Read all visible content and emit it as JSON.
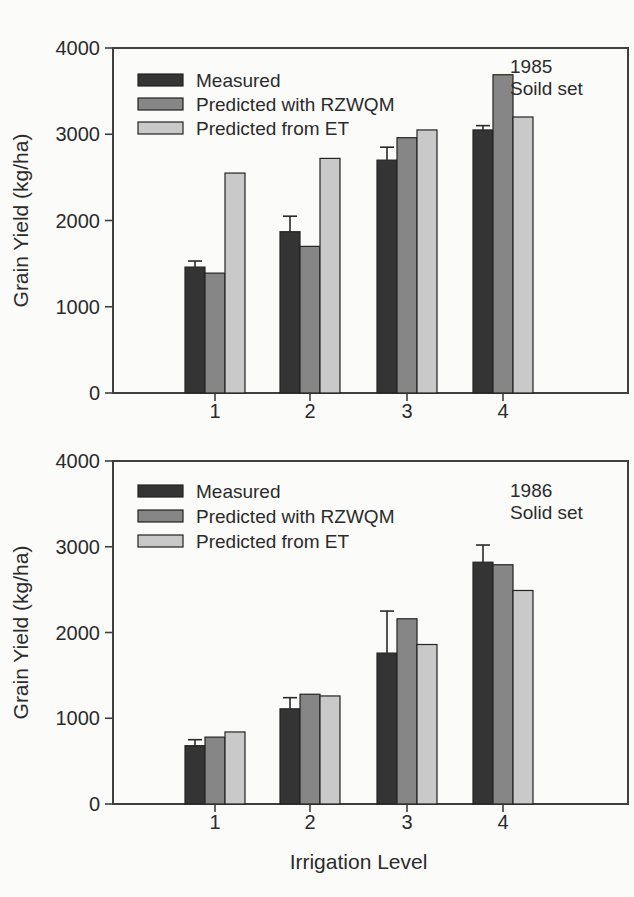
{
  "figure": {
    "background": "#fbfbfa",
    "text_color": "#2b2b2b",
    "axis_color": "#3f3f3f",
    "bar_outline_color": "#242424",
    "error_bar_color": "#2a2a2a"
  },
  "chart_data": [
    {
      "type": "bar",
      "annotation": [
        "1985",
        "Soild set"
      ],
      "ylabel": "Grain Yield (kg/ha)",
      "xlabel": "",
      "categories": [
        "1",
        "2",
        "3",
        "4"
      ],
      "ylim": [
        0,
        4000
      ],
      "yticks": [
        4000,
        3000,
        2000,
        1000,
        0
      ],
      "grid": false,
      "legend_position": "top-left",
      "series": [
        {
          "name": "Measured",
          "color": "#343434",
          "values": [
            1460,
            1870,
            2700,
            3050
          ],
          "errors_upper": [
            1530,
            2050,
            2850,
            3100
          ]
        },
        {
          "name": "Predicted with RZWQM",
          "color": "#868686",
          "values": [
            1390,
            1700,
            2960,
            3690
          ]
        },
        {
          "name": "Predicted from ET",
          "color": "#c9c9c9",
          "values": [
            2550,
            2720,
            3050,
            3200
          ]
        }
      ]
    },
    {
      "type": "bar",
      "annotation": [
        "1986",
        "Solid set"
      ],
      "ylabel": "Grain Yield (kg/ha)",
      "xlabel": "Irrigation Level",
      "categories": [
        "1",
        "2",
        "3",
        "4"
      ],
      "ylim": [
        0,
        4000
      ],
      "yticks": [
        4000,
        3000,
        2000,
        1000,
        0
      ],
      "grid": false,
      "legend_position": "top-left",
      "series": [
        {
          "name": "Measured",
          "color": "#343434",
          "values": [
            680,
            1110,
            1760,
            2820
          ],
          "errors_upper": [
            750,
            1240,
            2250,
            3020
          ]
        },
        {
          "name": "Predicted with RZWQM",
          "color": "#868686",
          "values": [
            780,
            1280,
            2160,
            2790
          ]
        },
        {
          "name": "Predicted from ET",
          "color": "#c9c9c9",
          "values": [
            840,
            1260,
            1860,
            2490
          ]
        }
      ]
    }
  ]
}
